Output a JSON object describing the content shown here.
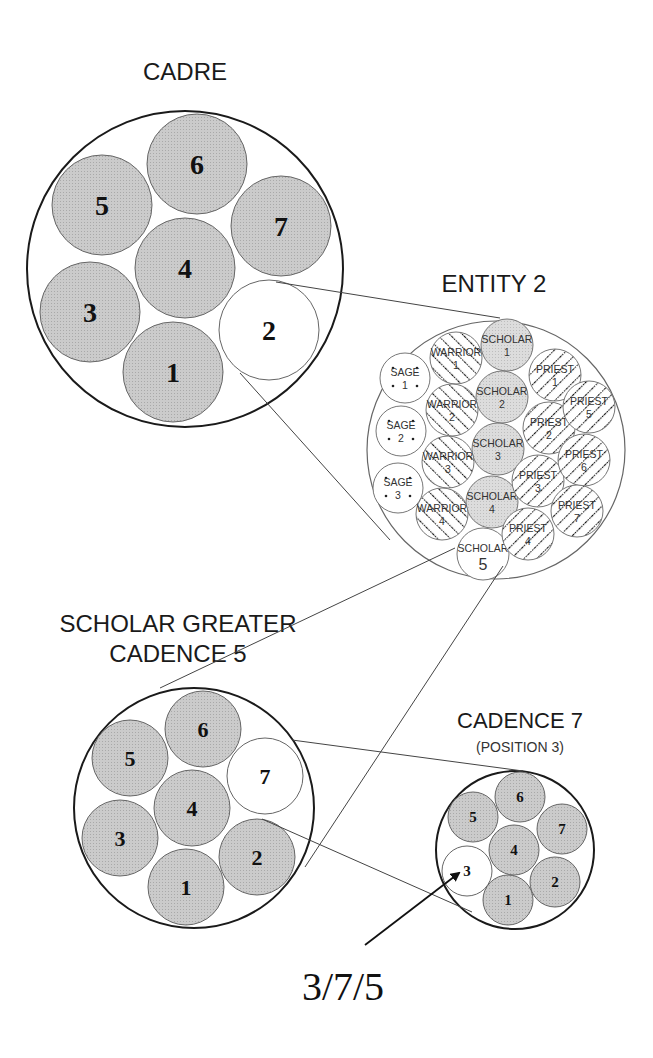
{
  "colors": {
    "ink": "#1a1a1a",
    "shaded": "#c8c8c8",
    "light_shaded": "#d8d8d8",
    "outline": "#555555",
    "background": "#ffffff"
  },
  "titles": {
    "cadre": "CADRE",
    "entity": "ENTITY 2",
    "sgc_line1": "SCHOLAR GREATER",
    "sgc_line2": "CADENCE 5",
    "cadence7": "CADENCE 7",
    "cadence7_sub": "(POSITION 3)",
    "result": "3/7/5"
  },
  "cadre": {
    "cx": 185,
    "cy": 269,
    "r": 158,
    "members": [
      {
        "label": "1",
        "cx": 173,
        "cy": 372,
        "r": 50,
        "highlight": false
      },
      {
        "label": "2",
        "cx": 269,
        "cy": 330,
        "r": 50,
        "highlight": true
      },
      {
        "label": "3",
        "cx": 90,
        "cy": 312,
        "r": 50,
        "highlight": false
      },
      {
        "label": "4",
        "cx": 185,
        "cy": 268,
        "r": 50,
        "highlight": false
      },
      {
        "label": "5",
        "cx": 102,
        "cy": 205,
        "r": 50,
        "highlight": false
      },
      {
        "label": "6",
        "cx": 197,
        "cy": 164,
        "r": 50,
        "highlight": false
      },
      {
        "label": "7",
        "cx": 281,
        "cy": 226,
        "r": 50,
        "highlight": false
      }
    ]
  },
  "entity": {
    "cx": 496,
    "cy": 450,
    "r": 129,
    "members": [
      {
        "role": "SCHOLAR",
        "num": "1",
        "cx": 507,
        "cy": 345,
        "r": 26,
        "fill": "shaded"
      },
      {
        "role": "SCHOLAR",
        "num": "2",
        "cx": 502,
        "cy": 397,
        "r": 26,
        "fill": "shaded"
      },
      {
        "role": "SCHOLAR",
        "num": "3",
        "cx": 498,
        "cy": 449,
        "r": 26,
        "fill": "shaded"
      },
      {
        "role": "SCHOLAR",
        "num": "4",
        "cx": 492,
        "cy": 502,
        "r": 26,
        "fill": "shaded"
      },
      {
        "role": "SCHOLAR",
        "num": "5",
        "cx": 483,
        "cy": 554,
        "r": 26,
        "fill": "plain"
      },
      {
        "role": "WARRIOR",
        "num": "1",
        "cx": 456,
        "cy": 358,
        "r": 26,
        "fill": "hatch-fwd"
      },
      {
        "role": "WARRIOR",
        "num": "2",
        "cx": 452,
        "cy": 410,
        "r": 26,
        "fill": "hatch-fwd"
      },
      {
        "role": "WARRIOR",
        "num": "3",
        "cx": 448,
        "cy": 462,
        "r": 26,
        "fill": "hatch-fwd"
      },
      {
        "role": "WARRIOR",
        "num": "4",
        "cx": 442,
        "cy": 514,
        "r": 26,
        "fill": "hatch-fwd"
      },
      {
        "role": "SAGE",
        "num": "1",
        "cx": 405,
        "cy": 378,
        "r": 25,
        "fill": "dots"
      },
      {
        "role": "SAGE",
        "num": "2",
        "cx": 401,
        "cy": 431,
        "r": 25,
        "fill": "dots"
      },
      {
        "role": "SAGE",
        "num": "3",
        "cx": 398,
        "cy": 488,
        "r": 25,
        "fill": "dots"
      },
      {
        "role": "PRIEST",
        "num": "1",
        "cx": 555,
        "cy": 375,
        "r": 26,
        "fill": "hatch-back"
      },
      {
        "role": "PRIEST",
        "num": "2",
        "cx": 549,
        "cy": 428,
        "r": 26,
        "fill": "hatch-back"
      },
      {
        "role": "PRIEST",
        "num": "3",
        "cx": 538,
        "cy": 481,
        "r": 26,
        "fill": "hatch-back"
      },
      {
        "role": "PRIEST",
        "num": "4",
        "cx": 528,
        "cy": 534,
        "r": 26,
        "fill": "hatch-back"
      },
      {
        "role": "PRIEST",
        "num": "5",
        "cx": 589,
        "cy": 407,
        "r": 26,
        "fill": "hatch-back"
      },
      {
        "role": "PRIEST",
        "num": "6",
        "cx": 584,
        "cy": 460,
        "r": 26,
        "fill": "hatch-back"
      },
      {
        "role": "PRIEST",
        "num": "7",
        "cx": 577,
        "cy": 511,
        "r": 26,
        "fill": "hatch-back"
      }
    ]
  },
  "sgc5": {
    "cx": 194,
    "cy": 808,
    "r": 120,
    "members": [
      {
        "label": "1",
        "cx": 186,
        "cy": 887,
        "r": 38,
        "highlight": false
      },
      {
        "label": "2",
        "cx": 257,
        "cy": 857,
        "r": 38,
        "highlight": false
      },
      {
        "label": "3",
        "cx": 120,
        "cy": 838,
        "r": 38,
        "highlight": false
      },
      {
        "label": "4",
        "cx": 192,
        "cy": 808,
        "r": 38,
        "highlight": false
      },
      {
        "label": "5",
        "cx": 130,
        "cy": 758,
        "r": 38,
        "highlight": false
      },
      {
        "label": "6",
        "cx": 203,
        "cy": 729,
        "r": 38,
        "highlight": false
      },
      {
        "label": "7",
        "cx": 265,
        "cy": 776,
        "r": 38,
        "highlight": true
      }
    ]
  },
  "cadence7": {
    "cx": 515,
    "cy": 850,
    "r": 79,
    "members": [
      {
        "label": "1",
        "cx": 508,
        "cy": 900,
        "r": 25,
        "highlight": false
      },
      {
        "label": "2",
        "cx": 555,
        "cy": 882,
        "r": 25,
        "highlight": false
      },
      {
        "label": "3",
        "cx": 467,
        "cy": 871,
        "r": 25,
        "highlight": true
      },
      {
        "label": "4",
        "cx": 514,
        "cy": 850,
        "r": 25,
        "highlight": false
      },
      {
        "label": "5",
        "cx": 473,
        "cy": 817,
        "r": 25,
        "highlight": false
      },
      {
        "label": "6",
        "cx": 520,
        "cy": 797,
        "r": 25,
        "highlight": false
      },
      {
        "label": "7",
        "cx": 562,
        "cy": 829,
        "r": 25,
        "highlight": false
      }
    ]
  },
  "connectors": [
    {
      "from": "cadre-member-2-top",
      "x1": 276,
      "y1": 282,
      "x2": 500,
      "y2": 318
    },
    {
      "from": "cadre-member-2-bottom",
      "x1": 240,
      "y1": 373,
      "x2": 390,
      "y2": 540
    },
    {
      "from": "scholar-5-left",
      "x1": 455,
      "y1": 548,
      "x2": 160,
      "y2": 688
    },
    {
      "from": "scholar-5-right",
      "x1": 503,
      "y1": 566,
      "x2": 305,
      "y2": 867
    },
    {
      "from": "sgc5-member-7-top",
      "x1": 292,
      "y1": 740,
      "x2": 523,
      "y2": 771
    },
    {
      "from": "sgc5-member-7-bottom",
      "x1": 262,
      "y1": 819,
      "x2": 472,
      "y2": 912
    }
  ],
  "arrow": {
    "x1": 365,
    "y1": 945,
    "x2": 459,
    "y2": 873
  }
}
